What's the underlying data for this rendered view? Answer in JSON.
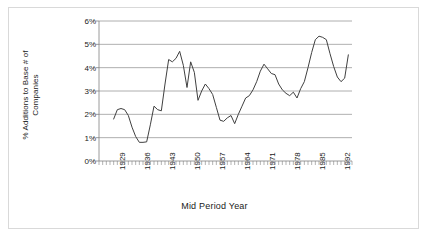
{
  "chart_data": {
    "type": "line",
    "title": "",
    "xlabel": "Mid Period Year",
    "ylabel": "% Additions to Base # of Companies",
    "ylabel_line1": "% Additions to Base # of",
    "ylabel_line2": "Companies",
    "ylim": [
      0,
      6
    ],
    "ytick_labels": [
      "0%",
      "1%",
      "2%",
      "3%",
      "4%",
      "5%",
      "6%"
    ],
    "ytick_values": [
      0,
      1,
      2,
      3,
      4,
      5,
      6
    ],
    "xlim": [
      1926,
      1995
    ],
    "xtick_labels": [
      "1929",
      "1936",
      "1943",
      "1950",
      "1957",
      "1964",
      "1971",
      "1978",
      "1985",
      "1992"
    ],
    "xtick_values": [
      1929,
      1936,
      1943,
      1950,
      1957,
      1964,
      1971,
      1978,
      1985,
      1992
    ],
    "grid": "horizontal",
    "legend": "none",
    "line_color": "#404040",
    "grid_color": "#9a9a9a",
    "axis_color": "#808080",
    "minor_ticks": "yearly",
    "x": [
      1930,
      1931,
      1932,
      1933,
      1934,
      1935,
      1936,
      1937,
      1938,
      1939,
      1940,
      1941,
      1942,
      1943,
      1944,
      1945,
      1946,
      1947,
      1948,
      1949,
      1950,
      1951,
      1952,
      1953,
      1954,
      1955,
      1956,
      1957,
      1958,
      1959,
      1960,
      1961,
      1962,
      1963,
      1964,
      1965,
      1966,
      1967,
      1968,
      1969,
      1970,
      1971,
      1972,
      1973,
      1974,
      1975,
      1976,
      1977,
      1978,
      1979,
      1980,
      1981,
      1982,
      1983,
      1984,
      1985,
      1986,
      1987,
      1988,
      1989,
      1990,
      1991,
      1992,
      1993,
      1994
    ],
    "values": [
      1.8,
      2.2,
      2.25,
      2.2,
      1.95,
      1.45,
      1.05,
      0.8,
      0.8,
      0.82,
      1.55,
      2.35,
      2.2,
      2.15,
      3.3,
      4.35,
      4.25,
      4.4,
      4.7,
      4.1,
      3.15,
      4.25,
      3.8,
      2.6,
      3.0,
      3.3,
      3.1,
      2.85,
      2.3,
      1.75,
      1.7,
      1.85,
      1.95,
      1.6,
      2.0,
      2.35,
      2.7,
      2.8,
      3.05,
      3.4,
      3.85,
      4.15,
      3.95,
      3.75,
      3.7,
      3.3,
      3.05,
      2.9,
      2.8,
      2.95,
      2.7,
      3.1,
      3.4,
      4.0,
      4.65,
      5.2,
      5.35,
      5.3,
      5.2,
      4.6,
      4.05,
      3.6,
      3.4,
      3.55,
      4.55
    ],
    "series_name": "Additions to Base"
  }
}
